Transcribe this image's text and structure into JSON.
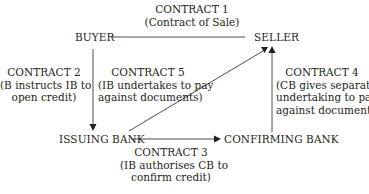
{
  "diagram": {
    "nodes": {
      "buyer": "BUYER",
      "seller": "SELLER",
      "issuing_bank": "ISSUING BANK",
      "confirming_bank": "CONFIRMING BANK"
    },
    "contracts": [
      {
        "title": "CONTRACT 1",
        "lines": [
          "(Contract of Sale)"
        ],
        "from": "BUYER",
        "to": "SELLER"
      },
      {
        "title": "CONTRACT 2",
        "lines": [
          "(B instructs IB to",
          "open credit)"
        ],
        "from": "BUYER",
        "to": "ISSUING BANK"
      },
      {
        "title": "CONTRACT 3",
        "lines": [
          "(IB authorises CB to",
          "confirm credit)"
        ],
        "from": "ISSUING BANK",
        "to": "CONFIRMING BANK"
      },
      {
        "title": "CONTRACT 4",
        "lines": [
          "(CB gives separate",
          "undertaking to pay",
          "against documents)"
        ],
        "from": "CONFIRMING BANK",
        "to": "SELLER"
      },
      {
        "title": "CONTRACT 5",
        "lines": [
          "(IB undertakes to pay",
          "against documents)"
        ],
        "from": "ISSUING BANK",
        "to": "SELLER"
      }
    ],
    "colors": {
      "line": "#231f20",
      "text": "#231f20",
      "background": "#ffffff"
    }
  }
}
